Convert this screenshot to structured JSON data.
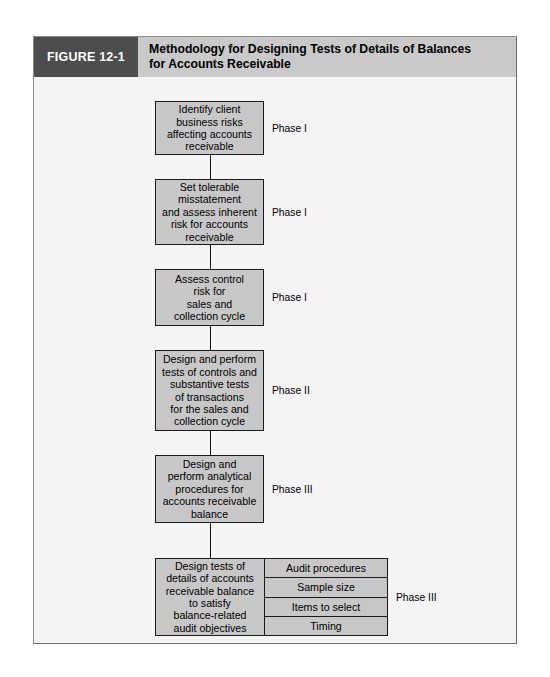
{
  "figure": {
    "tag": "FIGURE 12-1",
    "title": "Methodology for Designing Tests of Details of Balances\nfor Accounts Receivable"
  },
  "flow": {
    "nodes": [
      {
        "id": "identify-client-business-risks",
        "text": "Identify client\nbusiness risks\naffecting accounts\nreceivable",
        "phase": "Phase I"
      },
      {
        "id": "set-tolerable-misstatement",
        "text": "Set tolerable\nmisstatement\nand assess inherent\nrisk for accounts\nreceivable",
        "phase": "Phase I"
      },
      {
        "id": "assess-control-risk",
        "text": "Assess control\nrisk for\nsales and\ncollection cycle",
        "phase": "Phase I"
      },
      {
        "id": "design-perform-tests-of-controls",
        "text": "Design and perform\ntests of controls and\nsubstantive tests\nof transactions\nfor the sales and\ncollection cycle",
        "phase": "Phase II"
      },
      {
        "id": "design-perform-analytical-procedures",
        "text": "Design and\nperform analytical\nprocedures for\naccounts receivable\nbalance",
        "phase": "Phase III"
      }
    ],
    "composite": {
      "id": "design-tests-of-details-of-balances",
      "text": "Design tests of\ndetails of accounts\nreceivable balance\nto satisfy\nbalance-related\naudit objectives",
      "phase": "Phase III",
      "subitems": [
        "Audit procedures",
        "Sample size",
        "Items to select",
        "Timing"
      ]
    }
  }
}
